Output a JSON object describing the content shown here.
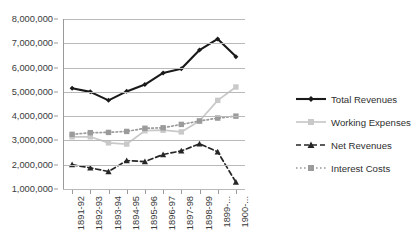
{
  "chart_data": {
    "type": "line",
    "title": "",
    "xlabel": "",
    "ylabel": "",
    "ylim": [
      1000000,
      8000000
    ],
    "ytick_labels": [
      "8,000,000",
      "7,000,000",
      "6,000,000",
      "5,000,000",
      "4,000,000",
      "3,000,000",
      "2,000,000",
      "1,000,000"
    ],
    "ytick_values": [
      8000000,
      7000000,
      6000000,
      5000000,
      4000000,
      3000000,
      2000000,
      1000000
    ],
    "grid": "horizontal",
    "legend_position": "right",
    "categories": [
      "1891-92",
      "1892-93",
      "1893-94",
      "1894-95",
      "1895-96",
      "1896-97",
      "1897-98",
      "1898-99",
      "1899-...",
      "1900-..."
    ],
    "series": [
      {
        "name": "Total Revenues",
        "color": "#1a1a1a",
        "marker": "diamond",
        "dash": "solid",
        "values": [
          5150000,
          5000000,
          4650000,
          5020000,
          5300000,
          5780000,
          5950000,
          6720000,
          7180000,
          6450000
        ]
      },
      {
        "name": "Working Expenses",
        "color": "#c9c9c9",
        "marker": "square",
        "dash": "solid",
        "values": [
          3150000,
          3150000,
          2900000,
          2850000,
          3400000,
          3420000,
          3350000,
          3800000,
          4650000,
          5200000
        ]
      },
      {
        "name": "Net Revenues",
        "color": "#262626",
        "marker": "triangle",
        "dash": "dashed",
        "values": [
          2000000,
          1870000,
          1720000,
          2170000,
          2130000,
          2420000,
          2570000,
          2860000,
          2530000,
          1280000
        ]
      },
      {
        "name": "Interest Costs",
        "color": "#9b9b9b",
        "marker": "square",
        "dash": "dotted",
        "values": [
          3250000,
          3320000,
          3330000,
          3370000,
          3500000,
          3520000,
          3660000,
          3800000,
          3920000,
          4000000
        ]
      }
    ]
  }
}
